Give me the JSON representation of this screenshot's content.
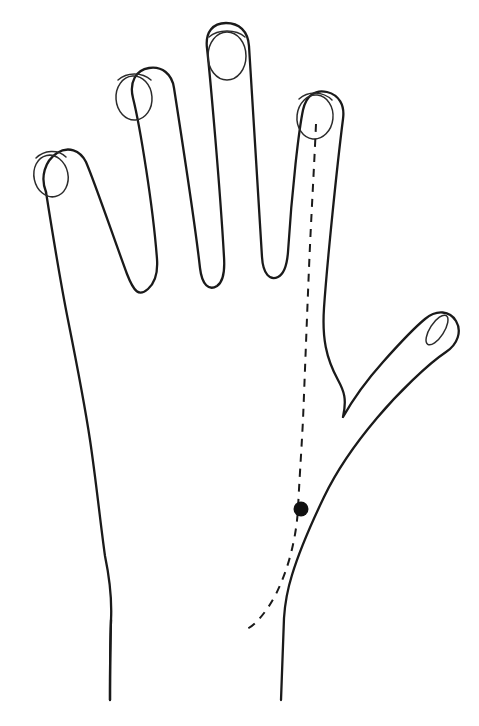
{
  "figure": {
    "background_color": "#ffffff",
    "outline_color": "#1a1a1a",
    "nail_color": "#2b2b2b",
    "meridian_color": "#1a1a1a",
    "point_color": "#111111",
    "canvas": {
      "width": 479,
      "height": 726
    }
  },
  "hand": {
    "outline": {
      "name": "hand-outline",
      "stroke_width": 2.3,
      "path": "M 46 192 C 40 177 45 161 57 153 C 68 146 80 150 86 162 C 95 183 113 236 127 274 C 134 292 139 297 148 289 C 155 283 158 273 157 259 C 153 206 140 126 133 98 C 129 82 136 70 149 68 C 162 66 172 74 174 88 C 181 133 196 232 200 268 C 202 285 209 291 217 286 C 223 282 225 272 224 257 C 220 186 210 75 207 48 C 205 32 213 23 226 23 C 239 23 248 31 249 46 C 252 96 259 206 262 257 C 263 274 270 281 278 277 C 284 274 287 265 288 252 C 292 188 299 129 303 110 C 306 96 315 89 327 92 C 339 95 345 105 343 119 C 337 166 327 264 324 308 C 322 338 326 358 338 380 C 344 391 347 399 343 417 C 352 401 366 381 383 362 C 399 344 414 328 425 319 C 437 309 450 311 456 321 C 462 331 458 344 446 352 C 428 364 398 393 377 418 C 355 444 336 472 324 497 C 312 522 299 552 292 575 C 287 591 285 602 284 618 C 283 648 282 676 281 700",
      "description": "Outer contour of hand: pinky, ring, middle, index fingers, thumb and right wrist edge"
    },
    "left_edge": {
      "name": "hand-left-edge",
      "path": "M 46 192 C 52 230 60 280 68 320 C 76 360 84 400 90 440 C 96 480 100 520 105 556 C 110 580 112 600 111 620 C 110 650 110 678 110 700",
      "description": "Left/ulnar border of hand down to wrist"
    },
    "fingers": [
      {
        "name": "pinky-finger",
        "label": "pinky",
        "tip_y": 148,
        "nail": {
          "cx": 51,
          "cy": 176,
          "rx": 17,
          "ry": 21,
          "rotate": -12
        }
      },
      {
        "name": "ring-finger",
        "label": "ring",
        "tip_y": 68,
        "nail": {
          "cx": 134,
          "cy": 98,
          "rx": 18,
          "ry": 22,
          "rotate": -4
        }
      },
      {
        "name": "middle-finger",
        "label": "middle",
        "tip_y": 23,
        "nail": {
          "cx": 227,
          "cy": 56,
          "rx": 19,
          "ry": 24,
          "rotate": 0
        }
      },
      {
        "name": "index-finger",
        "label": "index",
        "tip_y": 88,
        "nail": {
          "cx": 315,
          "cy": 117,
          "rx": 18,
          "ry": 22,
          "rotate": 6
        }
      },
      {
        "name": "thumb",
        "label": "thumb",
        "tip_y": 316,
        "nail": {
          "cx": 437,
          "cy": 330,
          "rx": 7,
          "ry": 17,
          "rotate": 33
        }
      }
    ],
    "web_valleys": [
      {
        "name": "valley-pinky-ring",
        "x": 148,
        "y": 292
      },
      {
        "name": "valley-ring-middle",
        "x": 217,
        "y": 288
      },
      {
        "name": "valley-middle-index",
        "x": 278,
        "y": 279
      },
      {
        "name": "valley-index-thumb",
        "x": 343,
        "y": 417
      }
    ],
    "wrist": {
      "name": "wrist",
      "left_x": 110,
      "right_x": 281,
      "bottom_y": 700
    }
  },
  "meridian": {
    "name": "meridian-line",
    "style": "dashed",
    "dash_length": 8,
    "gap_length": 7,
    "stroke_width": 2.0,
    "path": "M 316 124 C 314 170 311 220 309 268 C 307 316 305 370 303 420 C 301 458 299 486 298 509 C 296 540 288 570 276 594 C 266 613 255 625 247 629",
    "start": {
      "x": 316,
      "y": 124,
      "location": "index-fingertip"
    },
    "end": {
      "x": 247,
      "y": 629,
      "location": "wrist"
    }
  },
  "acupoint": {
    "name": "acupoint-marker",
    "cx": 301,
    "cy": 509,
    "r": 7.5,
    "fill": "#111111",
    "shape": "filled-circle"
  },
  "chart_data": {
    "type": "diagram",
    "elements": [
      {
        "kind": "outline",
        "label": "hand-outline"
      },
      {
        "kind": "dashed-line",
        "label": "meridian-line",
        "from": "index-fingertip",
        "to": "wrist"
      },
      {
        "kind": "point",
        "label": "acupoint",
        "x": 301,
        "y": 509
      }
    ]
  }
}
